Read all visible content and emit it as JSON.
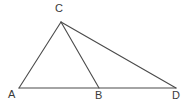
{
  "figure": {
    "background_color": "#ffffff",
    "stroke_color": "#4a4a4a",
    "stroke_width": 1.1,
    "label_color": "#3a3a3a",
    "width": 191,
    "height": 104,
    "points": {
      "A": {
        "name": "A",
        "x": 19,
        "y": 88
      },
      "B": {
        "name": "B",
        "x": 99,
        "y": 88
      },
      "C": {
        "name": "C",
        "x": 61,
        "y": 22
      },
      "D": {
        "name": "D",
        "x": 176,
        "y": 88
      }
    },
    "segments": [
      {
        "name": "segment-AC",
        "from": "A",
        "to": "C",
        "d": "M 19 88 L 61 22"
      },
      {
        "name": "segment-CB",
        "from": "C",
        "to": "B",
        "d": "M 61 22 L 99 88"
      },
      {
        "name": "segment-CD",
        "from": "C",
        "to": "D",
        "d": "M 61 22 L 176 88"
      },
      {
        "name": "segment-AD",
        "from": "A",
        "to": "D",
        "d": "M 19 88 L 176 88"
      }
    ],
    "labels": {
      "A": "A",
      "B": "B",
      "C": "C",
      "D": "D"
    }
  }
}
